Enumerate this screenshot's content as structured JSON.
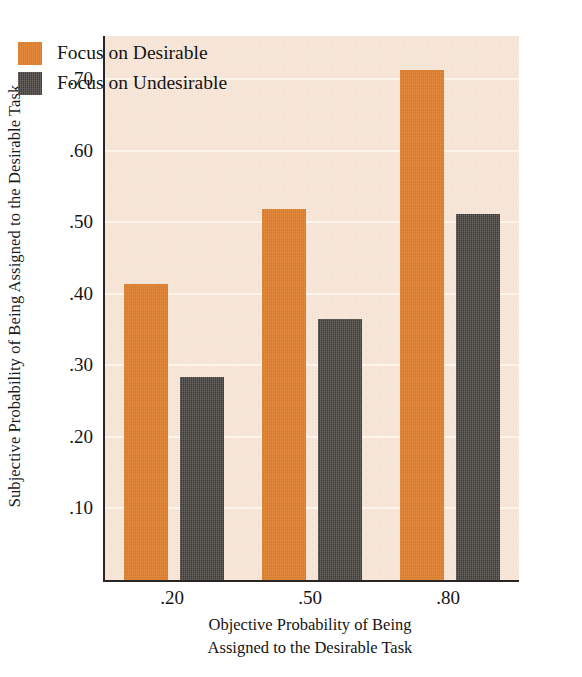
{
  "chart_data": {
    "type": "bar",
    "title": "",
    "xlabel": "Objective Probability of Being Assigned to the Desirable Task",
    "xlabel_line1": "Objective Probability of Being",
    "xlabel_line2": "Assigned to the Desirable Task",
    "ylabel": "Subjective Probability of Being Assigned to the Desirable Task",
    "categories": [
      ".20",
      ".50",
      ".80"
    ],
    "series": [
      {
        "name": "Focus on Desirable",
        "color": "#e0812f",
        "values": [
          0.414,
          0.518,
          0.712
        ]
      },
      {
        "name": "Focus on Undesirable",
        "color": "#4b4642",
        "values": [
          0.284,
          0.364,
          0.511
        ]
      }
    ],
    "ylim": [
      0.0,
      0.76
    ],
    "yticks": [
      ".10",
      ".20",
      ".30",
      ".40",
      ".50",
      ".60",
      ".70"
    ],
    "ytick_values": [
      0.1,
      0.2,
      0.3,
      0.4,
      0.5,
      0.6,
      0.7
    ],
    "grid": true,
    "gridline_color": "#fdf4ec",
    "legend_position": "top-left",
    "plot_background": "#f7e6d8",
    "axis_color": "#2a2422"
  },
  "legend": {
    "items": [
      {
        "label": "Focus on Desirable",
        "swatch": "desirable-swatch"
      },
      {
        "label": "Focus on Undesirable",
        "swatch": "undesirable-swatch"
      }
    ]
  }
}
